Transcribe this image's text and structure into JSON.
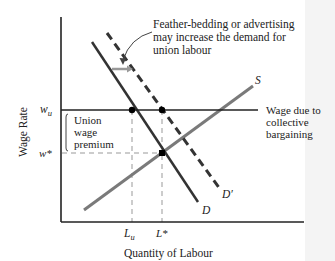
{
  "diagram": {
    "axes": {
      "xlabel": "Quantity of Labour",
      "ylabel": "Wage Rate"
    },
    "y_ticks": {
      "wu_main": "w",
      "wu_sub": "u",
      "wstar": "w*"
    },
    "x_ticks": {
      "lu_main": "L",
      "lu_sub": "u",
      "lstar": "L*"
    },
    "curves": {
      "supply": "S",
      "demand": "D",
      "demand_shifted": "D′"
    },
    "annotations": {
      "top_line1": "Feather-bedding or advertising",
      "top_line2": "may increase the demand for",
      "top_line3": "union labour",
      "wage_line1": "Wage due to",
      "wage_line2": "collective",
      "wage_line3": "bargaining",
      "premium_line1": "Union",
      "premium_line2": "wage",
      "premium_line3": "premium"
    },
    "colors": {
      "axis": "#222222",
      "demand": "#333333",
      "supply": "#777777",
      "guide": "#999999",
      "shift_arrow": "#999999"
    }
  }
}
